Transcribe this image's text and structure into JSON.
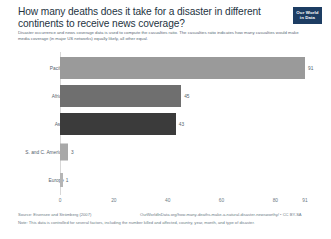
{
  "header": {
    "title": "How many deaths does it take for a disaster in different continents to receive news coverage?",
    "subtitle": "Disaster occurrence and news coverage data is used to compute the casualties ratio. The casualties ratio indicates how many casualties would make media coverage (in major US networks) equally likely, all other equal.",
    "logo_line1": "Our World",
    "logo_line2": "in Data"
  },
  "footer": {
    "source": "Source: Eisensee and Strömberg (2007)",
    "link": "OurWorldInData.org/how-many-deaths-make-a-natural-disaster-newsworthy/ • CC BY-SA",
    "note": "Note: This data is controlled for several factors, including the number killed and affected, country, year, month, and type of disaster."
  },
  "chart_data": {
    "type": "bar",
    "orientation": "horizontal",
    "title": "How many deaths does it take for a disaster in different continents to receive news coverage?",
    "xlabel": "",
    "ylabel": "",
    "xlim": [
      0,
      91
    ],
    "grid": false,
    "legend": "none",
    "xticks": [
      0,
      20,
      40,
      60,
      80,
      91
    ],
    "xtick_labels": [
      "0",
      "20",
      "40",
      "60",
      "80",
      "91"
    ],
    "categories": [
      "Pacific",
      "Africa",
      "Asia",
      "S. and C. America",
      "Europe"
    ],
    "values": [
      91,
      45,
      43,
      3,
      1
    ],
    "value_labels": [
      "91",
      "45",
      "43",
      "3",
      "1"
    ],
    "colors": [
      "#9a9a9a",
      "#6f6f6f",
      "#3b3b3b",
      "#a8a8a8",
      "#b5b5b5"
    ]
  }
}
